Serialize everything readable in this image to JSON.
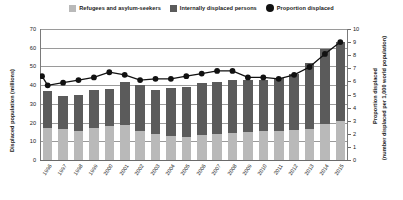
{
  "legend": {
    "items": [
      {
        "label": "Refugees and asylum-seekers",
        "icon": "square-swatch",
        "color": "#b9b9b9"
      },
      {
        "label": "Internally displaced persons",
        "icon": "square-swatch",
        "color": "#5b5b5b"
      },
      {
        "label": "Proportion displaced",
        "icon": "circle-marker",
        "color": "#111111"
      }
    ]
  },
  "chart_data": {
    "type": "bar",
    "title": "",
    "xlabel": "",
    "ylabel": "Displaced population (millions)",
    "y2label": "Proportion displaced (number displaced per 1,000 world population)",
    "ylim": [
      0,
      70
    ],
    "y2lim": [
      0,
      10
    ],
    "yticks": [
      0,
      10,
      20,
      30,
      40,
      50,
      60,
      70
    ],
    "y2ticks": [
      0,
      1,
      2,
      3,
      4,
      5,
      6,
      7,
      8,
      9,
      10
    ],
    "grid": true,
    "legend_position": "top-center",
    "categories": [
      "1996",
      "1997",
      "1998",
      "1999",
      "2000",
      "2001",
      "2002",
      "2003",
      "2004",
      "2005",
      "2006",
      "2007",
      "2008",
      "2009",
      "2010",
      "2011",
      "2012",
      "2013",
      "2014",
      "2015"
    ],
    "series": [
      {
        "name": "Refugees and asylum-seekers",
        "type": "bar",
        "stack": "total",
        "color": "#b9b9b9",
        "values": [
          17.0,
          16.5,
          15.5,
          17.0,
          18.0,
          18.5,
          15.5,
          14.0,
          13.0,
          12.5,
          13.5,
          14.0,
          14.5,
          15.0,
          15.3,
          15.5,
          15.8,
          16.5,
          19.5,
          21.0
        ]
      },
      {
        "name": "Internally displaced persons",
        "type": "bar",
        "stack": "total",
        "color": "#5b5b5b",
        "values": [
          20.0,
          17.5,
          19.5,
          20.5,
          20.0,
          23.0,
          24.5,
          23.5,
          25.5,
          26.5,
          27.5,
          27.5,
          28.0,
          28.0,
          27.7,
          28.5,
          30.2,
          35.5,
          40.0,
          42.0
        ]
      }
    ],
    "totals": [
      37.0,
      34.0,
      35.0,
      37.5,
      38.0,
      41.5,
      40.0,
      37.5,
      38.5,
      39.0,
      41.0,
      41.5,
      42.5,
      43.0,
      43.0,
      44.0,
      46.0,
      52.0,
      59.5,
      63.0
    ],
    "line_series": {
      "name": "Proportion displaced",
      "type": "line-marker",
      "axis": "y2",
      "color": "#111111",
      "values": [
        6.4,
        5.7,
        5.9,
        6.1,
        6.3,
        6.7,
        6.5,
        6.1,
        6.2,
        6.2,
        6.4,
        6.6,
        6.8,
        6.8,
        6.3,
        6.3,
        6.2,
        6.5,
        7.1,
        8.1,
        9.0
      ]
    }
  }
}
